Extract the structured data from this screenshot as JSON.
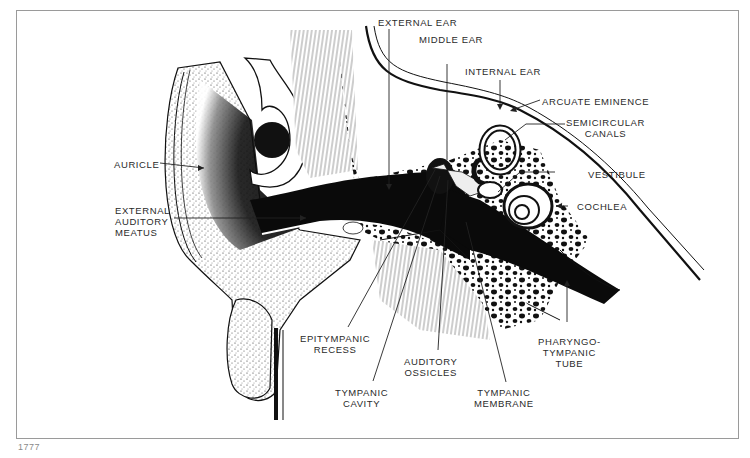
{
  "figure": {
    "number": "1777"
  },
  "labels": {
    "external_ear": "EXTERNAL EAR",
    "middle_ear": "MIDDLE EAR",
    "internal_ear": "INTERNAL EAR",
    "arcuate_eminence": "ARCUATE EMINENCE",
    "semicircular_canals": [
      "SEMICIRCULAR",
      "CANALS"
    ],
    "vestibule": "VESTIBULE",
    "cochlea": "COCHLEA",
    "auricle": "AURICLE",
    "external_auditory_meatus": [
      "EXTERNAL",
      "AUDITORY",
      "MEATUS"
    ],
    "epitympanic_recess": [
      "EPITYMPANIC",
      "RECESS"
    ],
    "auditory_ossicles": [
      "AUDITORY",
      "OSSICLES"
    ],
    "tympanic_cavity": [
      "TYMPANIC",
      "CAVITY"
    ],
    "tympanic_membrane": [
      "TYMPANIC",
      "MEMBRANE"
    ],
    "pharyngotympanic_tube": [
      "PHARYNGO-",
      "TYMPANIC",
      "TUBE"
    ]
  },
  "colors": {
    "ink": "#111111",
    "frame": "#9a9a9a",
    "caption": "#8a8a8a"
  }
}
